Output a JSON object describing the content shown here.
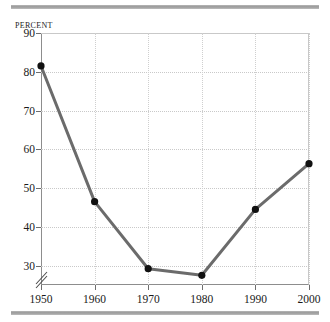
{
  "chart_data": {
    "type": "line",
    "title": "",
    "subtitle": "",
    "xlabel": "",
    "ylabel": "Percent",
    "categories": [
      "1950",
      "1960",
      "1970",
      "1980",
      "1990",
      "2000"
    ],
    "x": [
      1950,
      1960,
      1970,
      1980,
      1990,
      2000
    ],
    "values": [
      81.5,
      46.5,
      29.2,
      27.5,
      44.5,
      56.3
    ],
    "series": [
      {
        "name": "Percent",
        "values": [
          81.5,
          46.5,
          29.2,
          27.5,
          44.5,
          56.3
        ]
      }
    ],
    "ylim": [
      25,
      90
    ],
    "xlim": [
      1950,
      2000
    ],
    "yticks": [
      30,
      40,
      50,
      60,
      70,
      80,
      90
    ],
    "ytick_labels": [
      "30",
      "40",
      "50",
      "60",
      "70",
      "80",
      "90"
    ],
    "xticks": [
      1950,
      1960,
      1970,
      1980,
      1990,
      2000
    ],
    "xtick_labels": [
      "1950",
      "1960",
      "1970",
      "1980",
      "1990",
      "2000"
    ],
    "grid": true,
    "grid_style": "dotted",
    "legend": false,
    "legend_position": "none",
    "y_axis_break": true,
    "y_axis_break_note": "axis break mark below 30",
    "line_color": "#6b6b6b",
    "marker_color": "#111111",
    "marker_shape": "circle",
    "grid_color": "#c9c9c9",
    "axis_color": "#8d8d8d",
    "text_color": "#1a1a1a",
    "rule_color": "#9a9a9a",
    "background": "#ffffff"
  }
}
